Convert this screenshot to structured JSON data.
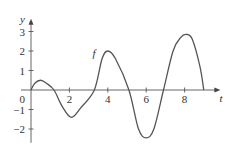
{
  "chart_data": {
    "type": "line",
    "title": "",
    "xlabel": "t",
    "ylabel": "y",
    "xlim": [
      0,
      9.5
    ],
    "ylim": [
      -2.5,
      3.5
    ],
    "grid": false,
    "legend": "none",
    "x_ticks": [
      2,
      4,
      6,
      8
    ],
    "x_tick_labels": [
      "2",
      "4",
      "6",
      "8"
    ],
    "y_ticks": [
      -2,
      -1,
      1,
      2,
      3
    ],
    "y_tick_labels": [
      "−2",
      "−1",
      "1",
      "2",
      "3"
    ],
    "origin_label": "0",
    "annotations": [
      {
        "text": "f",
        "x": 3.2,
        "y": 1.7
      }
    ],
    "series": [
      {
        "name": "f",
        "x": [
          0,
          0.2,
          0.5,
          0.8,
          1.2,
          1.6,
          2.1,
          2.6,
          3.3,
          3.7,
          4.0,
          4.4,
          5.1,
          5.6,
          6.0,
          6.4,
          6.9,
          7.4,
          7.8,
          8.1,
          8.4,
          8.8,
          9.0
        ],
        "y": [
          0,
          0.35,
          0.5,
          0.35,
          0,
          -0.8,
          -1.4,
          -0.9,
          0,
          1.6,
          2.0,
          1.6,
          0,
          -2.0,
          -2.45,
          -2.0,
          0,
          2.0,
          2.7,
          2.85,
          2.6,
          1.2,
          0
        ]
      }
    ]
  }
}
